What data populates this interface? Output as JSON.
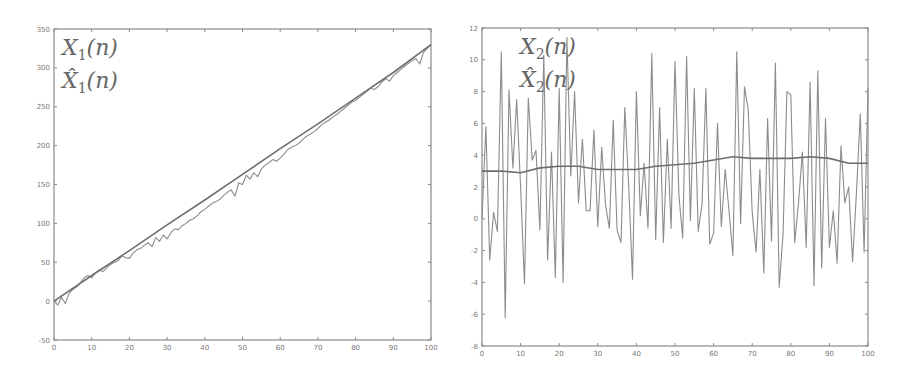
{
  "chart_data": [
    {
      "type": "line",
      "title": "",
      "xlabel": "",
      "ylabel": "",
      "xlim": [
        0,
        100
      ],
      "ylim": [
        -50,
        350
      ],
      "xticks": [
        0,
        10,
        20,
        30,
        40,
        50,
        60,
        70,
        80,
        90,
        100
      ],
      "yticks": [
        -50,
        0,
        50,
        100,
        150,
        200,
        250,
        300,
        350
      ],
      "grid": false,
      "legend_position": "upper-left",
      "legend": [
        "X_1(n)",
        "X̂_1(n)"
      ],
      "series": [
        {
          "name": "X_1(n)",
          "x": [
            0,
            1,
            2,
            3,
            4,
            5,
            6,
            7,
            8,
            9,
            10,
            11,
            12,
            13,
            14,
            15,
            16,
            17,
            18,
            19,
            20,
            21,
            22,
            23,
            24,
            25,
            26,
            27,
            28,
            29,
            30,
            31,
            32,
            33,
            34,
            35,
            36,
            37,
            38,
            39,
            40,
            41,
            42,
            43,
            44,
            45,
            46,
            47,
            48,
            49,
            50,
            51,
            52,
            53,
            54,
            55,
            56,
            57,
            58,
            59,
            60,
            61,
            62,
            63,
            64,
            65,
            66,
            67,
            68,
            69,
            70,
            71,
            72,
            73,
            74,
            75,
            76,
            77,
            78,
            79,
            80,
            81,
            82,
            83,
            84,
            85,
            86,
            87,
            88,
            89,
            90,
            91,
            92,
            93,
            94,
            95,
            96,
            97,
            98,
            99,
            100
          ],
          "values": [
            0,
            -5,
            5,
            -3,
            10,
            15,
            18,
            24,
            30,
            33,
            30,
            36,
            40,
            38,
            43,
            47,
            50,
            52,
            58,
            56,
            55,
            62,
            66,
            68,
            72,
            75,
            70,
            82,
            77,
            85,
            80,
            88,
            93,
            92,
            97,
            100,
            104,
            106,
            110,
            115,
            118,
            122,
            126,
            128,
            131,
            136,
            140,
            143,
            135,
            152,
            150,
            162,
            157,
            165,
            160,
            170,
            175,
            178,
            182,
            180,
            184,
            189,
            195,
            198,
            200,
            203,
            208,
            212,
            215,
            218,
            222,
            227,
            230,
            233,
            237,
            240,
            244,
            248,
            252,
            256,
            258,
            262,
            266,
            270,
            274,
            272,
            276,
            282,
            286,
            283,
            290,
            294,
            298,
            302,
            306,
            309,
            312,
            305,
            320,
            325,
            330
          ]
        },
        {
          "name": "X̂_1(n)",
          "x": [
            0,
            10,
            20,
            30,
            40,
            50,
            60,
            70,
            80,
            90,
            100
          ],
          "values": [
            0,
            33,
            65,
            98,
            130,
            163,
            196,
            228,
            261,
            294,
            330
          ]
        }
      ]
    },
    {
      "type": "line",
      "title": "",
      "xlabel": "",
      "ylabel": "",
      "xlim": [
        0,
        100
      ],
      "ylim": [
        -8,
        12
      ],
      "xticks": [
        0,
        10,
        20,
        30,
        40,
        50,
        60,
        70,
        80,
        90,
        100
      ],
      "yticks": [
        -8,
        -6,
        -4,
        -2,
        0,
        2,
        4,
        6,
        8,
        10,
        12
      ],
      "grid": false,
      "legend_position": "upper-left",
      "legend": [
        "X_2(n)",
        "X̂_2(n)"
      ],
      "series": [
        {
          "name": "X_2(n)",
          "x": [
            0,
            1,
            2,
            3,
            4,
            5,
            6,
            7,
            8,
            9,
            10,
            11,
            12,
            13,
            14,
            15,
            16,
            17,
            18,
            19,
            20,
            21,
            22,
            23,
            24,
            25,
            26,
            27,
            28,
            29,
            30,
            31,
            32,
            33,
            34,
            35,
            36,
            37,
            38,
            39,
            40,
            41,
            42,
            43,
            44,
            45,
            46,
            47,
            48,
            49,
            50,
            51,
            52,
            53,
            54,
            55,
            56,
            57,
            58,
            59,
            60,
            61,
            62,
            63,
            64,
            65,
            66,
            67,
            68,
            69,
            70,
            71,
            72,
            73,
            74,
            75,
            76,
            77,
            78,
            79,
            80,
            81,
            82,
            83,
            84,
            85,
            86,
            87,
            88,
            89,
            90,
            91,
            92,
            93,
            94,
            95,
            96,
            97,
            98,
            99,
            100
          ],
          "values": [
            0,
            5.8,
            -2.6,
            0.4,
            -0.8,
            10.5,
            -6.2,
            8.1,
            3.2,
            7.5,
            2.0,
            -4.1,
            7.6,
            3.7,
            4.3,
            -0.7,
            10.3,
            -2.6,
            4.2,
            -3.7,
            8.2,
            -4.0,
            11.4,
            2.7,
            8.0,
            1.0,
            5.0,
            0.5,
            0.5,
            5.6,
            -0.5,
            4.5,
            0.9,
            -0.6,
            6.2,
            -0.7,
            -1.5,
            7.0,
            2.1,
            -3.8,
            8.0,
            0.2,
            3.5,
            -0.6,
            10.4,
            -1.3,
            7.0,
            -1.5,
            5.0,
            -0.6,
            9.9,
            1.5,
            -1.2,
            10.2,
            -0.1,
            8.2,
            -0.8,
            0.9,
            8.2,
            -1.6,
            -0.9,
            6.0,
            -0.5,
            3.1,
            0.5,
            -2.3,
            10.5,
            -0.3,
            8.3,
            6.8,
            0.4,
            -2.1,
            3.1,
            -3.4,
            6.3,
            -1.4,
            9.8,
            -4.3,
            -0.9,
            8.0,
            7.8,
            -1.5,
            1.0,
            4.2,
            -1.8,
            8.6,
            -4.2,
            9.3,
            -3.1,
            6.3,
            -1.8,
            0.5,
            -2.8,
            4.6,
            1.0,
            2.0,
            -2.7,
            1.6,
            6.6,
            -2.1,
            8.2
          ]
        },
        {
          "name": "X̂_2(n)",
          "x": [
            0,
            5,
            10,
            15,
            20,
            25,
            30,
            35,
            40,
            45,
            50,
            55,
            60,
            65,
            70,
            75,
            80,
            85,
            90,
            95,
            100
          ],
          "values": [
            3.0,
            3.0,
            2.9,
            3.2,
            3.3,
            3.3,
            3.1,
            3.1,
            3.1,
            3.3,
            3.4,
            3.5,
            3.7,
            3.9,
            3.8,
            3.8,
            3.8,
            3.9,
            3.8,
            3.5,
            3.5
          ]
        }
      ]
    }
  ],
  "charts": {
    "left": {
      "legend_main_1": "X",
      "legend_sub_1": "1",
      "legend_args_1": "(n)",
      "legend_main_2": "X̂",
      "legend_sub_2": "1",
      "legend_args_2": "(n)"
    },
    "right": {
      "legend_main_1": "X",
      "legend_sub_1": "2",
      "legend_args_1": "(n)",
      "legend_main_2": "X̂",
      "legend_sub_2": "2",
      "legend_args_2": "(n)"
    }
  },
  "colors": {
    "axis": "#8a8a8a",
    "signal": "#8c8c8c",
    "estimate": "#6e6e6e",
    "text": "#777777"
  }
}
